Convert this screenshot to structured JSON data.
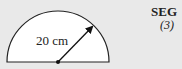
{
  "diagram": {
    "shape": "semicircle",
    "radius_label": "20 cm",
    "fill": "#ffffff",
    "stroke": "#222222"
  },
  "margin": {
    "section_label": "SEG",
    "marks": "(3)"
  }
}
